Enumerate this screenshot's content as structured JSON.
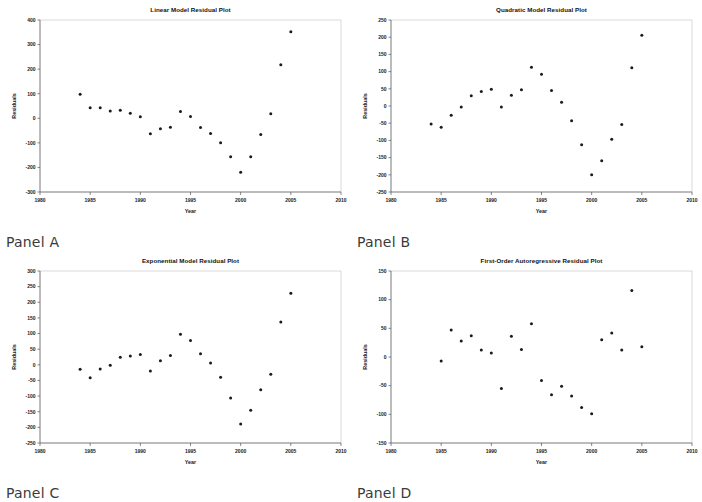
{
  "figure": {
    "panels": [
      {
        "caption": "Panel A",
        "chart_data": {
          "type": "scatter",
          "title": "Linear Model Residual Plot",
          "xlabel": "Year",
          "ylabel": "Residuals",
          "xlim": [
            1980,
            2010
          ],
          "ylim": [
            -300,
            400
          ],
          "xticks": [
            1980,
            1985,
            1990,
            1995,
            2000,
            2005,
            2010
          ],
          "yticks": [
            -300,
            -200,
            -100,
            0,
            100,
            200,
            300,
            400
          ],
          "grid": false,
          "legend": "none",
          "x": [
            1984,
            1985,
            1986,
            1987,
            1988,
            1989,
            1990,
            1991,
            1992,
            1993,
            1994,
            1995,
            1996,
            1997,
            1998,
            1999,
            2000,
            2001,
            2002,
            2003,
            2004,
            2005
          ],
          "values": [
            98,
            43,
            43,
            30,
            33,
            20,
            6,
            -63,
            -43,
            -36,
            28,
            7,
            -37,
            -62,
            -100,
            -157,
            -220,
            -157,
            -66,
            18,
            218,
            352
          ]
        }
      },
      {
        "caption": "Panel B",
        "chart_data": {
          "type": "scatter",
          "title": "Quadratic Model Residual Plot",
          "xlabel": "Year",
          "ylabel": "Residuals",
          "xlim": [
            1980,
            2010
          ],
          "ylim": [
            -250,
            250
          ],
          "xticks": [
            1980,
            1985,
            1990,
            1995,
            2000,
            2005,
            2010
          ],
          "yticks": [
            -250,
            -200,
            -150,
            -100,
            -50,
            0,
            50,
            100,
            150,
            200,
            250
          ],
          "grid": false,
          "legend": "none",
          "x": [
            1984,
            1985,
            1986,
            1987,
            1988,
            1989,
            1990,
            1991,
            1992,
            1993,
            1994,
            1995,
            1996,
            1997,
            1998,
            1999,
            2000,
            2001,
            2002,
            2003,
            2004,
            2005
          ],
          "values": [
            -52,
            -62,
            -27,
            -3,
            30,
            42,
            49,
            -3,
            31,
            47,
            113,
            92,
            45,
            11,
            -43,
            -113,
            -200,
            -159,
            -97,
            -54,
            111,
            206
          ]
        }
      },
      {
        "caption": "Panel C",
        "chart_data": {
          "type": "scatter",
          "title": "Exponential Model Residual Plot",
          "xlabel": "Year",
          "ylabel": "Residuals",
          "xlim": [
            1980,
            2010
          ],
          "ylim": [
            -250,
            300
          ],
          "xticks": [
            1980,
            1985,
            1990,
            1995,
            2000,
            2005,
            2010
          ],
          "yticks": [
            -250,
            -200,
            -150,
            -100,
            -50,
            0,
            50,
            100,
            150,
            200,
            250,
            300
          ],
          "grid": false,
          "legend": "none",
          "x": [
            1984,
            1985,
            1986,
            1987,
            1988,
            1989,
            1990,
            1991,
            1992,
            1993,
            1994,
            1995,
            1996,
            1997,
            1998,
            1999,
            2000,
            2001,
            2002,
            2003,
            2004,
            2005
          ],
          "values": [
            -14,
            -41,
            -13,
            -1,
            24,
            28,
            33,
            -20,
            13,
            30,
            98,
            78,
            35,
            6,
            -40,
            -106,
            -189,
            -145,
            -80,
            -30,
            137,
            229
          ]
        }
      },
      {
        "caption": "Panel D",
        "chart_data": {
          "type": "scatter",
          "title": "First-Order Autoregressive Residual Plot",
          "xlabel": "Year",
          "ylabel": "Residuals",
          "xlim": [
            1980,
            2010
          ],
          "ylim": [
            -150,
            150
          ],
          "xticks": [
            1980,
            1985,
            1990,
            1995,
            2000,
            2005,
            2010
          ],
          "yticks": [
            -150,
            -100,
            -50,
            0,
            50,
            100,
            150
          ],
          "grid": false,
          "legend": "none",
          "x": [
            1985,
            1986,
            1987,
            1988,
            1989,
            1990,
            1991,
            1992,
            1993,
            1994,
            1995,
            1996,
            1997,
            1998,
            1999,
            2000,
            2001,
            2002,
            2003,
            2004,
            2005
          ],
          "values": [
            -7,
            47,
            28,
            37,
            12,
            7,
            -55,
            36,
            13,
            58,
            -41,
            -66,
            -51,
            -68,
            -88,
            -99,
            30,
            42,
            12,
            116,
            18
          ]
        }
      }
    ]
  }
}
